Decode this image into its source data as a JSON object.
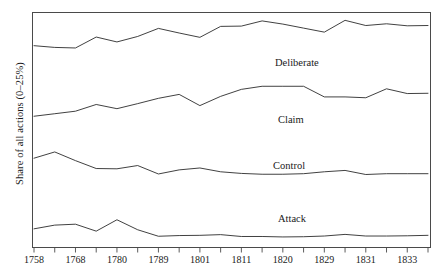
{
  "figure": {
    "ylabel": "Share of all actions (0–25%)",
    "background": "#ffffff",
    "line_color": "#2b2b2b",
    "frame_color": "#4a4a4a"
  },
  "chart_data": {
    "type": "line",
    "title": "",
    "xlabel": "",
    "ylabel": "Share of all actions (0–25%)",
    "grid": false,
    "legend": "inline-annotations",
    "ylim": [
      0,
      25
    ],
    "x_tick_labels": [
      "1758",
      "1768",
      "1780",
      "1789",
      "1801",
      "1811",
      "1820",
      "1829",
      "1831",
      "1833"
    ],
    "x_index": [
      0,
      1,
      2,
      3,
      4,
      5,
      6,
      7,
      8,
      9,
      10,
      11,
      12,
      13,
      14,
      15,
      16,
      17,
      18,
      19
    ],
    "note": "Each panel is an independent 0-25% band; values are share of all actions.",
    "series": [
      {
        "name": "Deliberate",
        "panel": 1,
        "label_x": 275,
        "label_y": 57,
        "values": [
          14.0,
          13.4,
          13.2,
          17.0,
          15.3,
          17.2,
          20.0,
          18.4,
          16.9,
          20.7,
          20.8,
          22.6,
          21.5,
          20.1,
          18.7,
          22.8,
          21.0,
          21.6,
          20.9,
          21.0
        ]
      },
      {
        "name": "Claim",
        "panel": 2,
        "label_x": 278,
        "label_y": 114,
        "values": [
          9.2,
          10.1,
          11.0,
          13.4,
          11.9,
          13.7,
          15.6,
          17.0,
          13.0,
          16.3,
          18.8,
          19.9,
          19.9,
          19.9,
          16.1,
          16.1,
          15.8,
          19.0,
          17.3,
          17.4
        ]
      },
      {
        "name": "Control",
        "panel": 3,
        "label_x": 273,
        "label_y": 160,
        "values": [
          13.9,
          16.2,
          13.0,
          10.1,
          10.0,
          11.2,
          8.1,
          9.6,
          10.3,
          8.9,
          8.3,
          8.0,
          8.0,
          8.2,
          8.9,
          9.4,
          7.9,
          8.2,
          8.2,
          8.2
        ]
      },
      {
        "name": "Attack",
        "panel": 4,
        "label_x": 278,
        "label_y": 213,
        "values": [
          7.4,
          9.0,
          9.4,
          6.4,
          11.3,
          7.0,
          4.2,
          4.5,
          4.6,
          4.9,
          4.1,
          4.1,
          3.9,
          4.0,
          4.3,
          5.0,
          4.3,
          4.3,
          4.4,
          4.6
        ]
      }
    ]
  }
}
